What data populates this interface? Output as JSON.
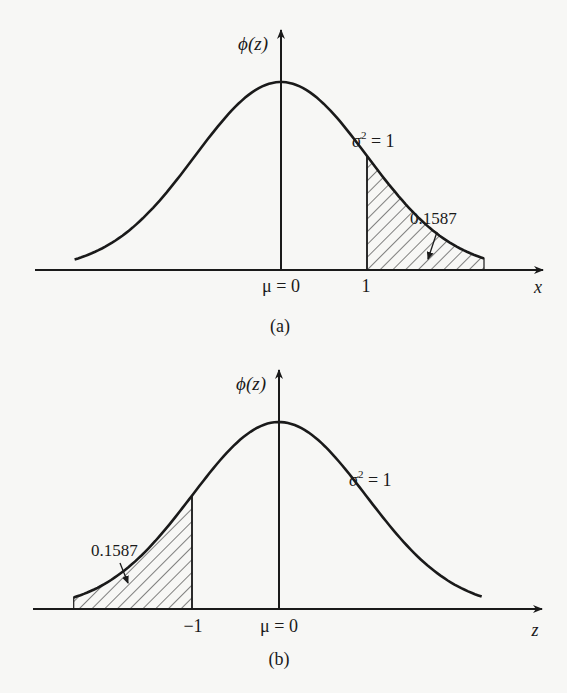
{
  "chart_data": [
    {
      "panel": "(a)",
      "type": "area",
      "title": "",
      "xlabel": "x",
      "ylabel": "ϕ(z)",
      "curve": "standard normal density",
      "mean_label": "μ = 0",
      "variance_label": "σ² = 1",
      "tick_labels": [
        "μ = 0",
        "1"
      ],
      "shaded_region": {
        "from": 1,
        "to": "+∞",
        "side": "right",
        "area": 0.1587
      },
      "annotation": "0.1587",
      "xlim": [
        -2.8,
        3.0
      ],
      "grid": false
    },
    {
      "panel": "(b)",
      "type": "area",
      "title": "",
      "xlabel": "z",
      "ylabel": "ϕ(z)",
      "curve": "standard normal density",
      "mean_label": "μ = 0",
      "variance_label": "σ² = 1",
      "tick_labels": [
        "−1",
        "μ = 0"
      ],
      "shaded_region": {
        "from": "−∞",
        "to": -1,
        "side": "left",
        "area": 0.1587
      },
      "annotation": "0.1587",
      "xlim": [
        -2.8,
        3.0
      ],
      "grid": false
    }
  ],
  "panels": {
    "a": {
      "ylabel": "ϕ(z)",
      "xlabel": "x",
      "variance": "σ",
      "variance_sup": "2",
      "variance_rest": " = 1",
      "tick_mu": "μ = 0",
      "tick_one": "1",
      "area": "0.1587",
      "caption": "(a)"
    },
    "b": {
      "ylabel": "ϕ(z)",
      "xlabel": "z",
      "variance": "σ",
      "variance_sup": "2",
      "variance_rest": " = 1",
      "tick_mu": "μ = 0",
      "tick_neg_one": "−1",
      "area": "0.1587",
      "caption": "(b)"
    }
  }
}
